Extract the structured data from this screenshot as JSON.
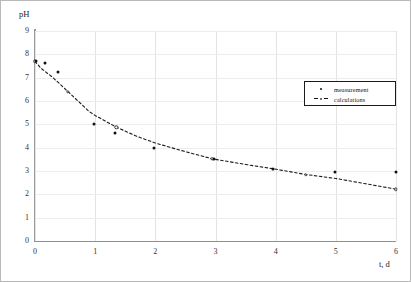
{
  "chart_data": {
    "type": "scatter",
    "title": "",
    "xlabel": "t, d",
    "ylabel": "pH",
    "xlim": [
      0,
      6
    ],
    "ylim": [
      0,
      9
    ],
    "xticks": [
      "0",
      "1",
      "2",
      "3",
      "4",
      "5",
      "6"
    ],
    "yticks": [
      "0",
      "1",
      "2",
      "3",
      "4",
      "5",
      "6",
      "7",
      "8",
      "9"
    ],
    "grid": true,
    "legend_position": "top-right",
    "series": [
      {
        "name": "measurement",
        "marker": "filled-dot",
        "points": [
          [
            0.02,
            7.7
          ],
          [
            0.17,
            7.63
          ],
          [
            0.38,
            7.25
          ],
          [
            0.98,
            5.0
          ],
          [
            1.33,
            4.62
          ],
          [
            1.98,
            4.0
          ],
          [
            2.98,
            3.52
          ],
          [
            3.95,
            3.1
          ],
          [
            4.98,
            2.95
          ],
          [
            6.0,
            2.95
          ]
        ]
      },
      {
        "name": "calculations",
        "marker": "open-circle-dashed",
        "points": [
          [
            0.0,
            7.7
          ],
          [
            0.1,
            7.4
          ],
          [
            0.3,
            7.0
          ],
          [
            0.55,
            6.4
          ],
          [
            0.9,
            5.55
          ],
          [
            1.0,
            5.38
          ],
          [
            1.35,
            4.88
          ],
          [
            1.7,
            4.48
          ],
          [
            2.0,
            4.2
          ],
          [
            2.4,
            3.9
          ],
          [
            2.95,
            3.52
          ],
          [
            3.5,
            3.28
          ],
          [
            3.95,
            3.1
          ],
          [
            4.5,
            2.85
          ],
          [
            5.0,
            2.68
          ],
          [
            5.5,
            2.45
          ],
          [
            6.0,
            2.22
          ]
        ]
      }
    ]
  },
  "legend": {
    "items": [
      {
        "label": "measurement",
        "symbol": "filled-dot"
      },
      {
        "label": "calculations",
        "symbol": "dashed-open-circle"
      }
    ]
  }
}
